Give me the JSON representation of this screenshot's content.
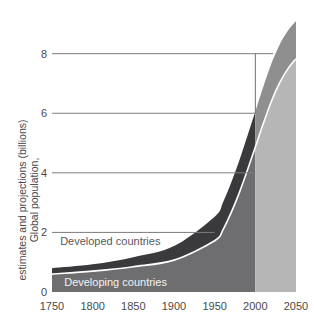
{
  "chart_data": {
    "type": "area",
    "title": "",
    "xlabel": "",
    "ylabel": "Global population, estimates and projections (billions)",
    "xlim": [
      1750,
      2050
    ],
    "ylim": [
      0,
      9.5
    ],
    "grid": true,
    "legend_position": "inline-annotations",
    "x_ticks": [
      "1750",
      "1800",
      "1850",
      "1900",
      "1950",
      "2000",
      "2050"
    ],
    "x_tick_values": [
      1750,
      1800,
      1850,
      1900,
      1950,
      2000,
      2050
    ],
    "y_ticks": [
      "0",
      "2",
      "4",
      "6",
      "8"
    ],
    "y_tick_values": [
      0,
      2,
      4,
      6,
      8
    ],
    "x": [
      1750,
      1800,
      1850,
      1900,
      1950,
      1960,
      1970,
      1980,
      1990,
      2000,
      2010,
      2020,
      2030,
      2040,
      2050
    ],
    "stacked": true,
    "series": [
      {
        "name": "Developing countries",
        "color": "#6e6e70",
        "projection_color": "#b6b6b6",
        "values": [
          0.6,
          0.7,
          0.85,
          1.07,
          1.72,
          2.08,
          2.65,
          3.31,
          4.07,
          4.87,
          5.67,
          6.42,
          7.03,
          7.49,
          7.83
        ]
      },
      {
        "name": "Developed countries",
        "color": "#3a3a3c",
        "projection_color": "#8f8f90",
        "values": [
          0.2,
          0.23,
          0.32,
          0.47,
          0.81,
          0.92,
          1.0,
          1.08,
          1.15,
          1.19,
          1.24,
          1.27,
          1.28,
          1.28,
          1.27
        ]
      }
    ],
    "annotations": [
      {
        "text": "Developed countries",
        "x": 1760,
        "y": 1.72,
        "style": "dark"
      },
      {
        "text": "Developing countries",
        "x": 1765,
        "y": 0.32,
        "style": "light"
      }
    ],
    "marker_line": {
      "name": "year-2000-divider",
      "x": 2000,
      "y_from": 8,
      "y_to": 6,
      "color": "#6f6f6f"
    },
    "gridlines": [
      {
        "value": 2,
        "x_end": 1950
      },
      {
        "value": 4,
        "x_end": 2000
      },
      {
        "value": 6,
        "x_end": 2000
      },
      {
        "value": 8,
        "x_end": 2022
      }
    ]
  },
  "colors": {
    "developing": "#6e6e70",
    "developed": "#3a3a3c",
    "developing_projection": "#b6b6b6",
    "developed_projection": "#8f8f90",
    "divider_line": "#ffffff",
    "grid": "#7c7c7c",
    "text": "#4a4a4a",
    "background": "#ffffff"
  }
}
